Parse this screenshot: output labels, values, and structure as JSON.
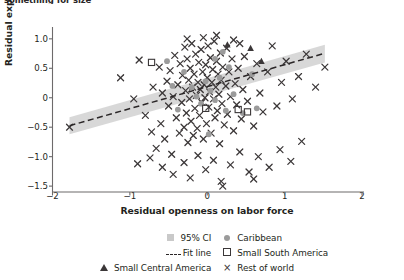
{
  "caption_fragment": "something for size",
  "axes": {
    "xlabel": "Residual openness on labor force",
    "ylabel": "Residual export lines on labor force",
    "xticks": [
      "−2",
      "−1",
      "0",
      "1",
      "2"
    ],
    "xtick_values": [
      -2,
      -1,
      0,
      1,
      2
    ],
    "yticks": [
      "1.0",
      "0.5",
      "0",
      "−0.5",
      "−1.0",
      "−1.5"
    ],
    "ytick_values": [
      1.0,
      0.5,
      0,
      -0.5,
      -1.0,
      -1.5
    ]
  },
  "legend": {
    "items": [
      {
        "label": "95% CI",
        "glyph": "ci-swatch-icon"
      },
      {
        "label": "Caribbean",
        "glyph": "filled-circle-icon"
      },
      {
        "label": "Fit line",
        "glyph": "dashed-line-icon"
      },
      {
        "label": "Small South America",
        "glyph": "open-square-icon"
      },
      {
        "label": "Small Central America",
        "glyph": "filled-triangle-icon"
      },
      {
        "label": "Rest of world",
        "glyph": "cross-x-icon"
      }
    ]
  },
  "colors": {
    "ci_band": "#c9c9c9",
    "fit_line": "#2a2627",
    "rest_of_world": "#3b3738",
    "caribbean": "#9b9b9b",
    "axis": "#6d6a6b",
    "text": "#231f20"
  },
  "chart_data": {
    "type": "scatter",
    "title": "",
    "xlabel": "Residual openness on labor force",
    "ylabel": "Residual export lines on labor force",
    "xlim": [
      -2.0,
      2.0
    ],
    "ylim": [
      -1.6,
      1.15
    ],
    "grid": false,
    "legend_position": "below-axes",
    "fit_line": {
      "label": "Fit line",
      "x": [
        -1.78,
        1.52
      ],
      "y": [
        -0.475,
        0.755
      ],
      "style": "dashed"
    },
    "ci_band": {
      "label": "95% CI",
      "x": [
        -1.78,
        1.52
      ],
      "upper": [
        -0.33,
        0.9
      ],
      "lower": [
        -0.62,
        0.6
      ]
    },
    "series": [
      {
        "name": "Rest of world",
        "marker": "x",
        "color": "#3b3738",
        "points": [
          [
            -1.78,
            -0.5
          ],
          [
            -1.12,
            0.34
          ],
          [
            -0.95,
            -0.02
          ],
          [
            -0.88,
            0.64
          ],
          [
            -0.8,
            -0.3
          ],
          [
            -0.72,
            -0.58
          ],
          [
            -0.7,
            0.18
          ],
          [
            -0.66,
            -0.86
          ],
          [
            -0.62,
            0.52
          ],
          [
            -0.6,
            -0.44
          ],
          [
            -0.58,
            0.08
          ],
          [
            -0.55,
            -0.7
          ],
          [
            -0.52,
            0.28
          ],
          [
            -0.5,
            -0.14
          ],
          [
            -0.48,
            0.46
          ],
          [
            -0.46,
            -0.96
          ],
          [
            -0.44,
            0.02
          ],
          [
            -0.42,
            0.72
          ],
          [
            -0.4,
            -0.34
          ],
          [
            -0.38,
            0.22
          ],
          [
            -0.36,
            -0.6
          ],
          [
            -0.35,
            0.58
          ],
          [
            -0.33,
            -0.08
          ],
          [
            -0.32,
            0.38
          ],
          [
            -0.3,
            -0.5
          ],
          [
            -0.29,
            0.86
          ],
          [
            -0.28,
            0.12
          ],
          [
            -0.27,
            -0.26
          ],
          [
            -0.26,
            0.66
          ],
          [
            -0.25,
            -0.76
          ],
          [
            -0.24,
            0.3
          ],
          [
            -0.23,
            -0.02
          ],
          [
            -0.22,
            0.5
          ],
          [
            -0.21,
            -0.4
          ],
          [
            -0.2,
            0.92
          ],
          [
            -0.19,
            0.18
          ],
          [
            -0.18,
            -0.64
          ],
          [
            -0.17,
            0.4
          ],
          [
            -0.16,
            -0.18
          ],
          [
            -0.15,
            0.74
          ],
          [
            -0.14,
            0.04
          ],
          [
            -0.13,
            -0.52
          ],
          [
            -0.12,
            0.26
          ],
          [
            -0.11,
            0.6
          ],
          [
            -0.1,
            -0.3
          ],
          [
            -0.09,
            0.14
          ],
          [
            -0.08,
            0.82
          ],
          [
            -0.07,
            -0.08
          ],
          [
            -0.06,
            0.44
          ],
          [
            -0.05,
            -0.7
          ],
          [
            -0.04,
            0.22
          ],
          [
            -0.03,
            0.0
          ],
          [
            -0.02,
            0.56
          ],
          [
            -0.01,
            -0.44
          ],
          [
            0.0,
            0.34
          ],
          [
            0.01,
            0.88
          ],
          [
            0.02,
            -0.16
          ],
          [
            0.03,
            0.1
          ],
          [
            0.04,
            0.68
          ],
          [
            0.05,
            -0.6
          ],
          [
            0.06,
            0.26
          ],
          [
            0.07,
            0.48
          ],
          [
            0.08,
            -0.02
          ],
          [
            0.09,
            0.96
          ],
          [
            0.1,
            -0.34
          ],
          [
            0.11,
            0.18
          ],
          [
            0.12,
            0.62
          ],
          [
            0.13,
            -0.22
          ],
          [
            0.14,
            0.4
          ],
          [
            0.15,
            0.06
          ],
          [
            0.16,
            -0.78
          ],
          [
            0.17,
            0.76
          ],
          [
            0.18,
            0.3
          ],
          [
            0.19,
            -0.1
          ],
          [
            0.2,
            0.52
          ],
          [
            0.22,
            -0.46
          ],
          [
            0.24,
            0.2
          ],
          [
            0.25,
            0.84
          ],
          [
            0.26,
            -0.28
          ],
          [
            0.28,
            0.44
          ],
          [
            0.3,
            0.02
          ],
          [
            0.32,
            0.66
          ],
          [
            0.34,
            -0.56
          ],
          [
            0.36,
            0.24
          ],
          [
            0.38,
            -0.12
          ],
          [
            0.4,
            0.5
          ],
          [
            0.42,
            0.92
          ],
          [
            0.44,
            -0.36
          ],
          [
            0.46,
            0.14
          ],
          [
            0.48,
            0.7
          ],
          [
            0.52,
            -0.06
          ],
          [
            0.56,
            0.36
          ],
          [
            0.6,
            -0.48
          ],
          [
            0.64,
            0.58
          ],
          [
            0.68,
            0.08
          ],
          [
            0.72,
            -0.24
          ],
          [
            0.78,
            0.44
          ],
          [
            0.84,
            0.88
          ],
          [
            0.9,
            -0.14
          ],
          [
            0.96,
            0.26
          ],
          [
            1.02,
            0.62
          ],
          [
            1.1,
            -0.02
          ],
          [
            1.18,
            0.36
          ],
          [
            1.28,
            0.74
          ],
          [
            1.4,
            0.18
          ],
          [
            1.52,
            0.52
          ],
          [
            -0.74,
            -1.02
          ],
          [
            -0.58,
            -1.18
          ],
          [
            -0.44,
            -1.3
          ],
          [
            -0.3,
            -1.1
          ],
          [
            -0.22,
            -1.36
          ],
          [
            -0.12,
            -0.98
          ],
          [
            -0.02,
            -1.22
          ],
          [
            0.08,
            -1.06
          ],
          [
            0.18,
            -1.42
          ],
          [
            0.3,
            -1.14
          ],
          [
            0.42,
            -0.92
          ],
          [
            0.54,
            -1.26
          ],
          [
            0.66,
            -1.0
          ],
          [
            0.8,
            -1.18
          ],
          [
            0.94,
            -0.88
          ],
          [
            1.08,
            -1.08
          ],
          [
            -0.9,
            -1.12
          ],
          [
            0.2,
            -1.5
          ],
          [
            0.6,
            -1.38
          ],
          [
            1.22,
            -0.74
          ],
          [
            -0.05,
            1.02
          ],
          [
            0.12,
            1.06
          ],
          [
            0.34,
            0.98
          ],
          [
            -0.26,
            1.0
          ]
        ]
      },
      {
        "name": "Caribbean",
        "marker": "o",
        "color": "#9b9b9b",
        "points": [
          [
            -0.52,
            0.62
          ],
          [
            -0.3,
            0.44
          ],
          [
            -0.2,
            0.18
          ],
          [
            -0.14,
            0.02
          ],
          [
            -0.08,
            -0.1
          ],
          [
            -0.02,
            0.28
          ],
          [
            0.04,
            0.12
          ],
          [
            0.1,
            -0.04
          ],
          [
            0.16,
            0.34
          ],
          [
            0.24,
            -0.22
          ],
          [
            0.34,
            0.06
          ],
          [
            0.46,
            -0.26
          ],
          [
            0.1,
            0.66
          ],
          [
            -0.38,
            -0.2
          ],
          [
            0.28,
            0.52
          ],
          [
            0.58,
            0.4
          ],
          [
            0.02,
            -0.62
          ],
          [
            0.64,
            -0.18
          ],
          [
            -0.45,
            0.2
          ],
          [
            0.2,
            0.78
          ]
        ]
      },
      {
        "name": "Small South America",
        "marker": "s-open",
        "color": "#3b3738",
        "points": [
          [
            -0.72,
            0.6
          ],
          [
            -0.02,
            -0.18
          ],
          [
            0.4,
            -0.2
          ],
          [
            0.52,
            -0.24
          ]
        ]
      },
      {
        "name": "Small Central America",
        "marker": "^",
        "color": "#3b3738",
        "points": [
          [
            0.56,
            0.84
          ],
          [
            0.7,
            0.62
          ],
          [
            0.26,
            0.9
          ]
        ]
      }
    ]
  }
}
